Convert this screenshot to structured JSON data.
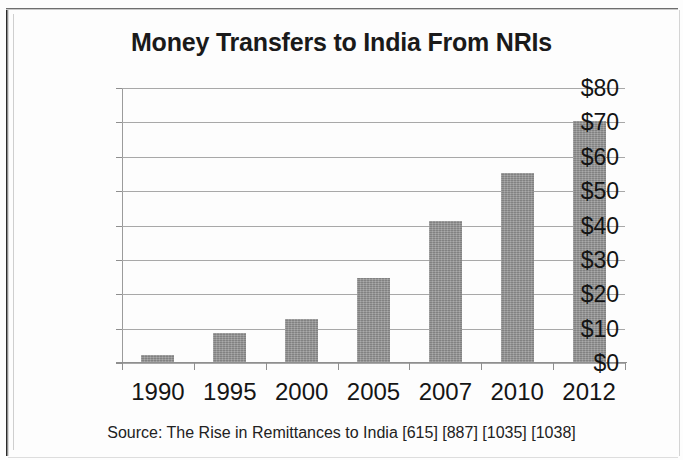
{
  "chart_data": {
    "type": "bar",
    "title": "Money Transfers to India From NRIs",
    "xlabel": "",
    "ylabel": "$ Billions",
    "categories": [
      "1990",
      "1995",
      "2000",
      "2005",
      "2007",
      "2010",
      "2012"
    ],
    "values": [
      2,
      8.5,
      12.5,
      24.5,
      41,
      55,
      70
    ],
    "ylim": [
      0,
      80
    ],
    "ytick_step": 10,
    "ytick_labels": [
      "$80",
      "$70",
      "$60",
      "$50",
      "$40",
      "$30",
      "$20",
      "$10",
      "$0"
    ],
    "ytick_values": [
      80,
      70,
      60,
      50,
      40,
      30,
      20,
      10,
      0
    ],
    "grid": true,
    "legend": false,
    "bar_color": "#919191",
    "source_note": "Source: The Rise in Remittances to India [615] [887]  [1035] [1038]"
  }
}
